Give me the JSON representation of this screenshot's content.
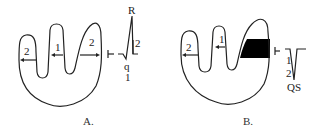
{
  "panels": [
    {
      "id": "A",
      "caption": "A.",
      "chambers": [
        {
          "label": "2",
          "position": "left"
        },
        {
          "label": "1",
          "position": "middle"
        },
        {
          "label": "2",
          "position": "right"
        }
      ],
      "ecg": {
        "peak_label": "R",
        "amplitude_label": "2",
        "dip_label": "q",
        "dip_amplitude_label": "1"
      }
    },
    {
      "id": "B",
      "caption": "B.",
      "chambers": [
        {
          "label": "2",
          "position": "left"
        },
        {
          "label": "1",
          "position": "middle"
        },
        {
          "label": "",
          "position": "right",
          "filled": true
        }
      ],
      "ecg": {
        "upper_label": "1",
        "lower_label": "2",
        "complex_label": "QS"
      }
    }
  ],
  "colors": {
    "line": "#222222",
    "infarct_fill": "#000000",
    "background": "#ffffff"
  }
}
